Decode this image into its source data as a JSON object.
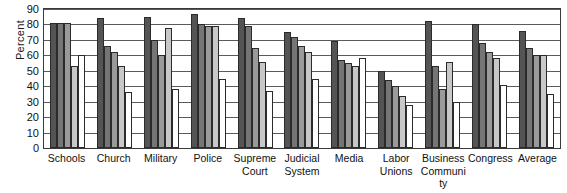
{
  "chart_data": {
    "type": "bar",
    "title": "",
    "subtitle": "",
    "xlabel": "",
    "ylabel": "Percent",
    "ylim": [
      0,
      90
    ],
    "ytick_step": 10,
    "yticks": [
      0,
      10,
      20,
      30,
      40,
      50,
      60,
      70,
      80,
      90
    ],
    "ytick_labels": [
      "0",
      "10",
      "20",
      "30",
      "40",
      "50",
      "60",
      "70",
      "80",
      "90"
    ],
    "grid": true,
    "legend": false,
    "legend_position": "none",
    "categories": [
      "Schools",
      "Church",
      "Military",
      "Police",
      "Supreme Court",
      "Judicial System",
      "Media",
      "Labor Unions",
      "Business Community",
      "Congress",
      "Average"
    ],
    "category_lines": [
      [
        "Schools"
      ],
      [
        "Church"
      ],
      [
        "Military"
      ],
      [
        "Police"
      ],
      [
        "Supreme",
        "Court"
      ],
      [
        "Judicial",
        "System"
      ],
      [
        "Media"
      ],
      [
        "Labor",
        "Unions"
      ],
      [
        "Business",
        "Community"
      ],
      [
        "Congress"
      ],
      [
        "Average"
      ]
    ],
    "series": [
      {
        "name": "Series 1",
        "color": "#545454",
        "values": [
          81,
          84,
          85,
          87,
          84,
          75,
          69,
          50,
          82,
          80,
          76
        ]
      },
      {
        "name": "Series 2",
        "color": "#757575",
        "values": [
          81,
          66,
          70,
          80,
          79,
          72,
          57,
          44,
          53,
          68,
          65
        ]
      },
      {
        "name": "Series 3",
        "color": "#9a9a9a",
        "values": [
          81,
          62,
          60,
          79,
          65,
          66,
          55,
          40,
          38,
          62,
          60
        ]
      },
      {
        "name": "Series 4",
        "color": "#c8c8c8",
        "values": [
          53,
          53,
          78,
          79,
          56,
          62,
          53,
          34,
          56,
          58,
          60
        ]
      },
      {
        "name": "Series 5",
        "color": "#ffffff",
        "values": [
          60,
          36,
          38,
          45,
          37,
          45,
          58,
          28,
          30,
          41,
          35
        ]
      }
    ]
  }
}
